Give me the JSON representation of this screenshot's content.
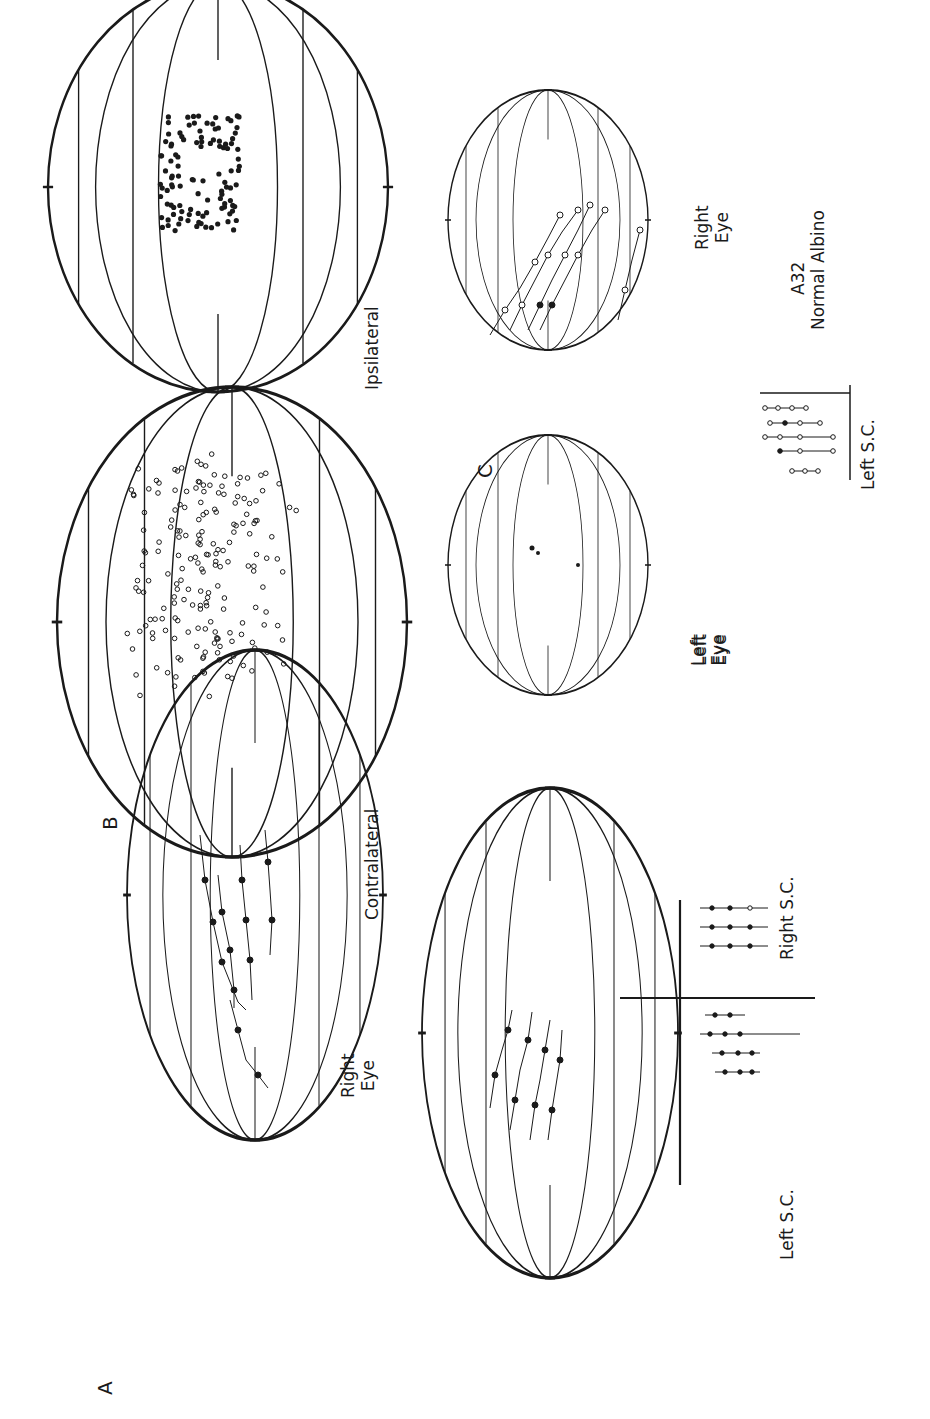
{
  "figure": {
    "orientation": "rotated 90deg counter-clockwise",
    "panels": [
      {
        "id": "A",
        "label": "A"
      },
      {
        "id": "B",
        "label": "B"
      },
      {
        "id": "C",
        "label": "C"
      }
    ],
    "labels": {
      "panel_a": "A",
      "panel_b": "B",
      "panel_c": "C",
      "a_right_eye": "Right\nEye",
      "a_left_eye": "Left\nEye",
      "a_left_sc": "Left S.C.",
      "a_right_sc": "Right S.C.",
      "b_contralateral": "Contralateral",
      "b_ipsilateral": "Ipsilateral",
      "c_left_eye": "Left\nEye",
      "c_right_eye": "Right\nEye",
      "c_left_sc": "Left S.C.",
      "c_animal_id": "A32",
      "c_animal_type": "Normal Albino"
    },
    "colors": {
      "ink": "#1a1a1a",
      "background": "#ffffff"
    }
  }
}
